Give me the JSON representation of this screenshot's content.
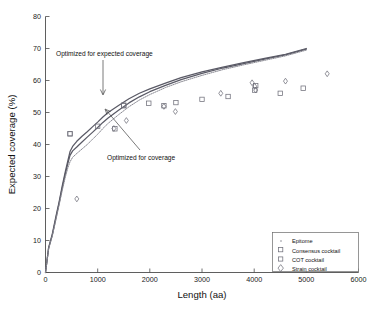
{
  "chart_data": {
    "type": "scatter",
    "title": "",
    "xlabel": "Length (aa)",
    "ylabel": "Expected coverage (%)",
    "xlim": [
      0,
      6000
    ],
    "ylim": [
      0,
      80
    ],
    "xticks": [
      0,
      1000,
      2000,
      3000,
      4000,
      5000,
      6000
    ],
    "yticks": [
      0,
      10,
      20,
      30,
      40,
      50,
      60,
      70,
      80
    ],
    "grid": false,
    "legend_position": "lower-right",
    "legend": [
      {
        "label": "Epitome",
        "marker": "dot"
      },
      {
        "label": "Consensus cocktail",
        "marker": "square"
      },
      {
        "label": "COT cocktail",
        "marker": "square"
      },
      {
        "label": "Strain cocktail",
        "marker": "diamond"
      }
    ],
    "annotations": [
      {
        "text": "Optimized for expected coverage",
        "x": 1100,
        "y": 65.5,
        "points_to_x": 1150,
        "points_to_y": 54.0
      },
      {
        "text": "Optimized for coverage",
        "x": 2000,
        "y": 36.5,
        "points_to_x": 1180,
        "points_to_y": 50.5
      }
    ],
    "series": [
      {
        "name": "Optimized for expected coverage",
        "type": "line",
        "style": "solid",
        "points": [
          [
            0,
            0
          ],
          [
            60,
            7.8
          ],
          [
            130,
            12.0
          ],
          [
            200,
            17.5
          ],
          [
            260,
            22.0
          ],
          [
            320,
            27.0
          ],
          [
            380,
            31.5
          ],
          [
            430,
            35.0
          ],
          [
            470,
            37.8
          ],
          [
            520,
            39.4
          ],
          [
            600,
            41.0
          ],
          [
            700,
            42.6
          ],
          [
            800,
            44.0
          ],
          [
            900,
            45.5
          ],
          [
            1000,
            47.0
          ],
          [
            1100,
            48.6
          ],
          [
            1200,
            50.0
          ],
          [
            1400,
            52.2
          ],
          [
            1600,
            54.3
          ],
          [
            1800,
            56.0
          ],
          [
            2000,
            57.4
          ],
          [
            2300,
            59.2
          ],
          [
            2600,
            60.9
          ],
          [
            3000,
            62.7
          ],
          [
            3400,
            64.2
          ],
          [
            3800,
            65.6
          ],
          [
            4200,
            66.9
          ],
          [
            4600,
            68.2
          ],
          [
            5000,
            70.0
          ]
        ]
      },
      {
        "name": "Optimized for coverage",
        "type": "line",
        "style": "solid",
        "points": [
          [
            0,
            0
          ],
          [
            60,
            7.6
          ],
          [
            130,
            11.7
          ],
          [
            200,
            17.0
          ],
          [
            260,
            21.5
          ],
          [
            320,
            26.4
          ],
          [
            380,
            30.8
          ],
          [
            430,
            34.2
          ],
          [
            470,
            36.6
          ],
          [
            520,
            38.0
          ],
          [
            600,
            39.2
          ],
          [
            700,
            40.8
          ],
          [
            800,
            42.3
          ],
          [
            900,
            43.8
          ],
          [
            1000,
            45.3
          ],
          [
            1100,
            46.9
          ],
          [
            1200,
            48.3
          ],
          [
            1400,
            50.7
          ],
          [
            1600,
            53.0
          ],
          [
            1800,
            54.9
          ],
          [
            2000,
            56.5
          ],
          [
            2300,
            58.5
          ],
          [
            2600,
            60.3
          ],
          [
            3000,
            62.2
          ],
          [
            3400,
            63.9
          ],
          [
            3800,
            65.3
          ],
          [
            4200,
            66.7
          ],
          [
            4600,
            68.0
          ],
          [
            5000,
            69.8
          ]
        ]
      },
      {
        "name": "Epitome",
        "type": "line",
        "style": "dotted",
        "points": [
          [
            0,
            0
          ],
          [
            60,
            7.4
          ],
          [
            130,
            11.4
          ],
          [
            200,
            16.5
          ],
          [
            260,
            21.0
          ],
          [
            320,
            25.6
          ],
          [
            380,
            29.8
          ],
          [
            430,
            32.8
          ],
          [
            470,
            34.6
          ],
          [
            520,
            36.0
          ],
          [
            600,
            37.2
          ],
          [
            700,
            38.6
          ],
          [
            800,
            40.0
          ],
          [
            900,
            41.6
          ],
          [
            1000,
            43.2
          ],
          [
            1100,
            45.0
          ],
          [
            1200,
            46.6
          ],
          [
            1400,
            49.3
          ],
          [
            1600,
            51.8
          ],
          [
            1800,
            53.9
          ],
          [
            2000,
            55.6
          ],
          [
            2300,
            57.8
          ],
          [
            2600,
            59.6
          ],
          [
            3000,
            61.6
          ],
          [
            3400,
            63.4
          ],
          [
            3800,
            64.9
          ],
          [
            4200,
            66.3
          ],
          [
            4600,
            67.7
          ],
          [
            5000,
            69.5
          ]
        ]
      },
      {
        "name": "Consensus cocktail",
        "type": "scatter",
        "marker": "square",
        "points": [
          [
            470,
            43.4
          ],
          [
            1000,
            45.7
          ],
          [
            1330,
            44.9
          ],
          [
            1500,
            52.1
          ],
          [
            1980,
            52.9
          ],
          [
            2270,
            52.1
          ],
          [
            2500,
            53.1
          ],
          [
            3000,
            54.1
          ],
          [
            3500,
            55.0
          ],
          [
            4030,
            58.4
          ],
          [
            4500,
            56.0
          ],
          [
            4940,
            57.6
          ]
        ]
      },
      {
        "name": "COT cocktail",
        "type": "scatter",
        "marker": "square",
        "points": [
          [
            470,
            43.3
          ],
          [
            1500,
            52.3
          ],
          [
            4010,
            57.0
          ]
        ]
      },
      {
        "name": "Strain cocktail",
        "type": "scatter",
        "marker": "diamond",
        "points": [
          [
            600,
            23.0
          ],
          [
            1310,
            45.0
          ],
          [
            1550,
            47.5
          ],
          [
            2270,
            51.9
          ],
          [
            2490,
            50.3
          ],
          [
            3360,
            56.0
          ],
          [
            3960,
            59.3
          ],
          [
            4010,
            58.2
          ],
          [
            4030,
            57.0
          ],
          [
            4600,
            59.8
          ],
          [
            5400,
            62.1
          ]
        ]
      }
    ]
  },
  "axes": {
    "x_tick_labels": [
      "0",
      "1000",
      "2000",
      "3000",
      "4000",
      "5000",
      "6000"
    ],
    "y_tick_labels": [
      "0",
      "10",
      "20",
      "30",
      "40",
      "50",
      "60",
      "70",
      "80"
    ]
  }
}
